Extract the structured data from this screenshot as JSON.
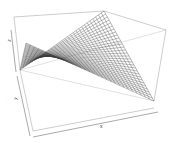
{
  "chart_data": {
    "type": "surface3d",
    "renderer": "persp",
    "title": "",
    "xlabel": "x",
    "ylabel": "y",
    "zlabel": "z",
    "axes_ticks": false,
    "box": true,
    "surface": "hyperbolic paraboloid (saddle) wireframe mesh",
    "grid_resolution": 30,
    "colors": {
      "mesh": "#3a3a3a",
      "box": "#9a9a9a",
      "axis": "#555555",
      "background": "#ffffff"
    }
  }
}
